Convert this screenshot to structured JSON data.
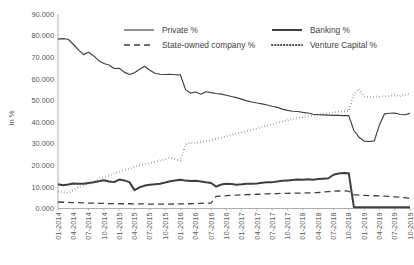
{
  "chart_data": {
    "type": "line",
    "title": "",
    "xlabel": "",
    "ylabel": "In %",
    "ylim": [
      0,
      90
    ],
    "ytick_labels": [
      "0.000",
      "10.000",
      "20.000",
      "30.000",
      "40.000",
      "50.000",
      "60.000",
      "70.000",
      "80.000",
      "90.000"
    ],
    "ytick_values": [
      0,
      10,
      20,
      30,
      40,
      50,
      60,
      70,
      80,
      90
    ],
    "grid": false,
    "legend_position": "top-center",
    "xtick_labels": [
      "01-2014",
      "04-2014",
      "07-2014",
      "10-2014",
      "01-2015",
      "04-2015",
      "07-2015",
      "10-2015",
      "01-2016",
      "04-2016",
      "07-2016",
      "10-2016",
      "01-2017",
      "04-2017",
      "07-2017",
      "10-2017",
      "01-2018",
      "04-2018",
      "07-2018",
      "10-2018",
      "01-2019",
      "04-2019",
      "07-2019",
      "10-2019"
    ],
    "x_count": 70,
    "series": [
      {
        "name": "Private %",
        "style": "solid-thin",
        "color": "#3f3f3f",
        "values": [
          78.4,
          78.6,
          78.3,
          76.0,
          73.4,
          71.2,
          72.3,
          70.6,
          68.4,
          67.1,
          66.4,
          64.8,
          64.9,
          63.1,
          62.0,
          62.8,
          64.4,
          65.8,
          64.0,
          62.6,
          62.1,
          62.0,
          62.1,
          61.9,
          61.8,
          55.0,
          53.4,
          53.9,
          52.9,
          54.0,
          53.6,
          53.2,
          52.9,
          52.4,
          51.8,
          51.3,
          50.6,
          49.8,
          49.3,
          48.8,
          48.4,
          47.9,
          47.3,
          46.8,
          46.0,
          45.4,
          45.0,
          44.9,
          44.5,
          44.2,
          43.6,
          43.4,
          43.3,
          43.2,
          43.1,
          43.1,
          43.0,
          43.0,
          36.1,
          33.0,
          31.2,
          31.0,
          31.3,
          38.6,
          43.8,
          44.1,
          44.2,
          43.6,
          43.4,
          44.0
        ]
      },
      {
        "name": "Banking %",
        "style": "solid-thick",
        "color": "#3f3f3f",
        "values": [
          11.2,
          10.8,
          11.1,
          11.6,
          11.5,
          11.4,
          11.8,
          12.1,
          12.6,
          13.1,
          12.5,
          12.2,
          13.4,
          13.0,
          12.2,
          8.5,
          9.8,
          10.6,
          11.0,
          11.2,
          11.5,
          12.0,
          12.6,
          13.0,
          13.3,
          12.9,
          12.7,
          12.8,
          12.5,
          12.1,
          11.8,
          10.1,
          11.1,
          11.4,
          11.3,
          11.0,
          11.2,
          11.5,
          11.4,
          11.6,
          11.9,
          12.1,
          12.2,
          12.5,
          12.8,
          13.0,
          13.2,
          13.4,
          13.3,
          13.5,
          13.3,
          13.6,
          13.8,
          14.0,
          15.6,
          16.2,
          16.4,
          16.3,
          0.6,
          0.6,
          0.6,
          0.6,
          0.6,
          0.6,
          0.6,
          0.6,
          0.6,
          0.6,
          0.6,
          0.6
        ]
      },
      {
        "name": "State-owned company %",
        "style": "dashed",
        "color": "#3f3f3f",
        "values": [
          3.0,
          2.9,
          2.8,
          2.7,
          2.7,
          2.6,
          2.5,
          2.5,
          2.4,
          2.4,
          2.3,
          2.3,
          2.2,
          2.2,
          2.2,
          2.1,
          2.1,
          2.1,
          2.0,
          2.0,
          2.0,
          2.0,
          2.0,
          2.1,
          2.1,
          2.2,
          2.2,
          2.3,
          2.4,
          2.5,
          2.5,
          5.6,
          5.8,
          6.0,
          6.1,
          6.2,
          6.3,
          6.4,
          6.5,
          6.6,
          6.7,
          6.8,
          6.9,
          6.9,
          7.0,
          7.0,
          7.1,
          7.1,
          7.2,
          7.2,
          7.3,
          7.4,
          7.6,
          7.8,
          8.0,
          8.1,
          8.2,
          8.0,
          6.4,
          6.2,
          6.1,
          6.0,
          5.9,
          5.8,
          5.7,
          5.6,
          5.4,
          5.2,
          5.0,
          4.6
        ]
      },
      {
        "name": "Venture Capital %",
        "style": "dotted",
        "color": "#3f3f3f",
        "values": [
          7.9,
          7.5,
          7.2,
          8.4,
          9.8,
          10.6,
          11.5,
          12.4,
          13.6,
          14.6,
          15.2,
          16.3,
          17.0,
          17.8,
          18.4,
          19.3,
          20.0,
          20.6,
          21.0,
          21.6,
          22.2,
          22.8,
          23.5,
          22.6,
          22.1,
          29.6,
          30.5,
          30.2,
          30.8,
          31.2,
          31.6,
          32.2,
          32.8,
          33.4,
          34.0,
          34.5,
          35.2,
          35.8,
          36.4,
          37.0,
          37.8,
          38.4,
          39.0,
          39.6,
          40.3,
          40.8,
          41.4,
          41.8,
          42.2,
          42.6,
          43.1,
          43.5,
          43.8,
          44.1,
          44.4,
          44.8,
          45.0,
          45.2,
          52.8,
          55.4,
          51.8,
          51.4,
          51.9,
          51.6,
          51.9,
          52.2,
          52.4,
          52.0,
          52.6,
          53.0
        ]
      }
    ]
  },
  "legend": {
    "items": [
      {
        "label": "Private %",
        "style": "solid-thin"
      },
      {
        "label": "Banking %",
        "style": "solid-thick"
      },
      {
        "label": "State-owned company %",
        "style": "dashed"
      },
      {
        "label": "Venture Capital %",
        "style": "dotted"
      }
    ]
  }
}
